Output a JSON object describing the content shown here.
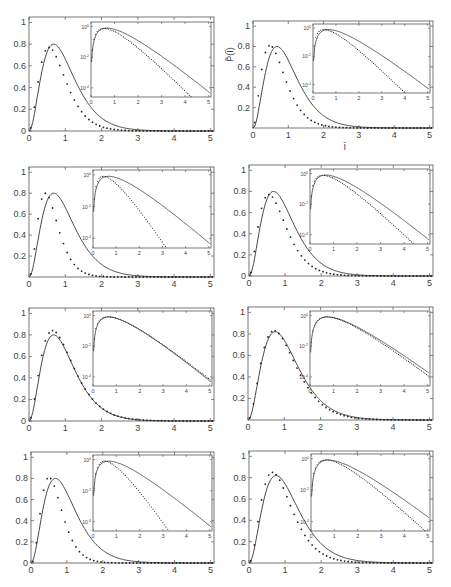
{
  "figure": {
    "width": 451,
    "height": 587,
    "layout": "4 rows x 2 columns of panels, each with a log-scale inset",
    "line_color": "#333333",
    "marker_color": "#222222",
    "axis_color": "#555555",
    "ylabel_panel": 2,
    "ylabel": "P̃(Ĩ)",
    "xlabel_panel": 2,
    "xlabel": "Ĩ"
  },
  "chart_data": [
    {
      "panel": 1,
      "type": "line+scatter",
      "axes": {
        "left": 29,
        "top": 17,
        "right": 214,
        "bottom": 131
      },
      "inset": {
        "left": 91,
        "top": 22,
        "right": 211,
        "bottom": 97
      },
      "xlim": [
        0,
        5.1
      ],
      "ylim": [
        0,
        1.05
      ],
      "xticks": [
        0,
        1,
        2,
        3,
        4,
        5
      ],
      "yticks": [
        0,
        0.2,
        0.4,
        0.6,
        0.8,
        1
      ],
      "inset_yticks": [
        "10^0",
        "10^-2",
        "10^-4"
      ],
      "inset_xticks": [
        0,
        1,
        2,
        3,
        4,
        5
      ],
      "theory_peak_x": 0.68,
      "theory_peak_y": 0.8,
      "data_peak_x": 0.55,
      "data_peak_y": 0.77,
      "tail_ratio": 1.0
    },
    {
      "panel": 2,
      "type": "line+scatter",
      "axes": {
        "left": 253,
        "top": 21,
        "right": 433,
        "bottom": 128
      },
      "inset": {
        "left": 313,
        "top": 24,
        "right": 430,
        "bottom": 93
      },
      "xlim": [
        0,
        5.1
      ],
      "ylim": [
        0,
        1.05
      ],
      "xticks": [
        0,
        1,
        2,
        3,
        4,
        5
      ],
      "yticks": [
        0.2,
        0.4,
        0.6,
        0.8,
        1
      ],
      "inset_yticks": [
        "10^0",
        "10^-2",
        "10^-4"
      ],
      "inset_xticks": [
        0,
        1,
        2,
        3,
        4,
        5
      ],
      "theory_peak_x": 0.68,
      "theory_peak_y": 0.8,
      "data_peak_x": 0.48,
      "data_peak_y": 0.81,
      "tail_ratio": 0.9
    },
    {
      "panel": 3,
      "type": "line+scatter",
      "axes": {
        "left": 29,
        "top": 167,
        "right": 214,
        "bottom": 277
      },
      "inset": {
        "left": 93,
        "top": 170,
        "right": 211,
        "bottom": 248
      },
      "xlim": [
        0,
        5.1
      ],
      "ylim": [
        0,
        1.05
      ],
      "xticks": [
        0,
        1,
        2,
        3,
        4,
        5
      ],
      "yticks": [
        0.2,
        0.4,
        0.6,
        0.8,
        1
      ],
      "inset_yticks": [
        "10^0",
        "10^-2",
        "10^-4"
      ],
      "inset_xticks": [
        0,
        1,
        2,
        3,
        4,
        5
      ],
      "theory_peak_x": 0.68,
      "theory_peak_y": 0.8,
      "data_peak_x": 0.45,
      "data_peak_y": 0.8,
      "tail_ratio": 1.15
    },
    {
      "panel": 4,
      "type": "line+scatter",
      "axes": {
        "left": 249,
        "top": 165,
        "right": 433,
        "bottom": 276
      },
      "inset": {
        "left": 310,
        "top": 169,
        "right": 430,
        "bottom": 244
      },
      "xlim": [
        0,
        5.1
      ],
      "ylim": [
        0,
        1.05
      ],
      "xticks": [
        0,
        1,
        2,
        3,
        4,
        5
      ],
      "yticks": [
        0,
        0.2,
        0.4,
        0.6,
        0.8,
        1
      ],
      "inset_yticks": [
        "10^0",
        "10^-2",
        "10^-4"
      ],
      "inset_xticks": [
        0,
        1,
        2,
        3,
        4,
        5
      ],
      "theory_peak_x": 0.68,
      "theory_peak_y": 0.8,
      "data_peak_x": 0.55,
      "data_peak_y": 0.77,
      "tail_ratio": 0.95
    },
    {
      "panel": 5,
      "type": "line+scatter",
      "axes": {
        "left": 29,
        "top": 308,
        "right": 214,
        "bottom": 421
      },
      "inset": {
        "left": 93,
        "top": 311,
        "right": 212,
        "bottom": 386
      },
      "xlim": [
        0,
        5.1
      ],
      "ylim": [
        0,
        1.05
      ],
      "xticks": [
        0,
        1,
        2,
        3,
        4,
        5
      ],
      "yticks": [
        0,
        0.2,
        0.4,
        0.6,
        0.8,
        1
      ],
      "inset_yticks": [
        "10^0",
        "10^-2",
        "10^-4"
      ],
      "inset_xticks": [
        0,
        1,
        2,
        3,
        4,
        5
      ],
      "theory_peak_x": 0.68,
      "theory_peak_y": 0.8,
      "data_peak_x": 0.65,
      "data_peak_y": 0.84,
      "tail_ratio": 0.92
    },
    {
      "panel": 6,
      "type": "line+scatter",
      "axes": {
        "left": 248,
        "top": 307,
        "right": 433,
        "bottom": 420
      },
      "inset": {
        "left": 310,
        "top": 311,
        "right": 430,
        "bottom": 386
      },
      "xlim": [
        0,
        5.1
      ],
      "ylim": [
        0,
        1.05
      ],
      "xticks": [
        0,
        1,
        2,
        3,
        4,
        5
      ],
      "yticks": [
        0.2,
        0.4,
        0.6,
        0.8,
        1
      ],
      "inset_yticks": [
        "10^0",
        "10^-2",
        "10^-4"
      ],
      "inset_xticks": [
        0,
        1,
        2,
        3,
        4,
        5
      ],
      "theory_peak_x": 0.75,
      "theory_peak_y": 0.82,
      "data_peak_x": 0.72,
      "data_peak_y": 0.83,
      "tail_ratio": 1.0
    },
    {
      "panel": 7,
      "type": "line+scatter",
      "axes": {
        "left": 31,
        "top": 452,
        "right": 214,
        "bottom": 563
      },
      "inset": {
        "left": 93,
        "top": 455,
        "right": 212,
        "bottom": 531
      },
      "xlim": [
        0,
        5.1
      ],
      "ylim": [
        0,
        1.05
      ],
      "xticks": [
        0,
        1,
        2,
        3,
        4,
        5
      ],
      "yticks": [
        0,
        0.2,
        0.4,
        0.6,
        0.8,
        1
      ],
      "inset_yticks": [
        "10^0",
        "10^-2",
        "10^-4"
      ],
      "inset_xticks": [
        0,
        1,
        2,
        3,
        4,
        5
      ],
      "theory_peak_x": 0.68,
      "theory_peak_y": 0.8,
      "data_peak_x": 0.5,
      "data_peak_y": 0.81,
      "tail_ratio": 1.3
    },
    {
      "panel": 8,
      "type": "line+scatter",
      "axes": {
        "left": 249,
        "top": 451,
        "right": 433,
        "bottom": 563
      },
      "inset": {
        "left": 311,
        "top": 454,
        "right": 430,
        "bottom": 531
      },
      "xlim": [
        0,
        5.1
      ],
      "ylim": [
        0,
        1.05
      ],
      "xticks": [
        0,
        1,
        2,
        3,
        4,
        5
      ],
      "yticks": [
        0,
        0.2,
        0.4,
        0.6,
        0.8,
        1
      ],
      "inset_yticks": [
        "10^0",
        "10^-2",
        "10^-4"
      ],
      "inset_xticks": [
        0,
        1,
        2,
        3,
        4,
        5
      ],
      "theory_peak_x": 0.75,
      "theory_peak_y": 0.82,
      "data_peak_x": 0.65,
      "data_peak_y": 0.85,
      "tail_ratio": 1.05
    }
  ]
}
